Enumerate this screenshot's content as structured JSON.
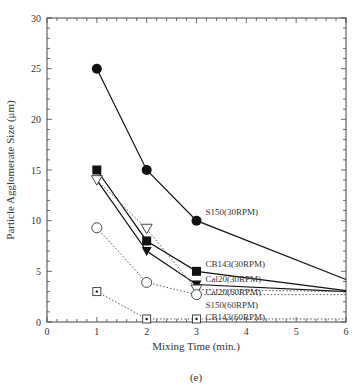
{
  "chart_data": {
    "type": "line",
    "title": "",
    "caption": "(e)",
    "xlabel": "Mixing Time (min.)",
    "ylabel": "Particle Agglomerate Size (μm)",
    "xlim": [
      0,
      6
    ],
    "ylim": [
      0,
      30
    ],
    "x_ticks": [
      0,
      1,
      2,
      3,
      4,
      5,
      6
    ],
    "y_ticks": [
      0,
      5,
      10,
      15,
      20,
      25,
      30
    ],
    "grid": false,
    "legend": "inline labels at x=3",
    "series": [
      {
        "name": "S150(30RPM)",
        "marker": "filled-circle",
        "line": "solid",
        "x": [
          1,
          2,
          3,
          6
        ],
        "values": [
          25,
          15,
          10,
          4.2
        ],
        "label_y": 10.9
      },
      {
        "name": "CB143(30RPM)",
        "marker": "filled-square",
        "line": "solid",
        "x": [
          1,
          2,
          3,
          6
        ],
        "values": [
          15,
          8,
          5,
          3.1
        ],
        "label_y": 5.7
      },
      {
        "name": "Cal20(30RPM)",
        "marker": "filled-triangle-down",
        "line": "solid",
        "x": [
          1,
          2,
          3,
          6
        ],
        "values": [
          14,
          7,
          3.7,
          3.0
        ],
        "label_y": 4.2
      },
      {
        "name": "Cal20(60RPM)",
        "marker": "open-triangle-down",
        "line": "dotted",
        "x": [
          1,
          2,
          3,
          6
        ],
        "values": [
          14,
          9.2,
          3.2,
          3.0
        ],
        "label_y": 3.0
      },
      {
        "name": "S150(60RPM)",
        "marker": "open-circle",
        "line": "dotted",
        "x": [
          1,
          2,
          3,
          6
        ],
        "values": [
          9.3,
          3.9,
          2.7,
          2.7
        ],
        "label_y": 1.7
      },
      {
        "name": "CB143(60RPM)",
        "marker": "dotted-square",
        "line": "dotted",
        "x": [
          1,
          2,
          3,
          6
        ],
        "values": [
          3,
          0.3,
          0.3,
          0.3
        ],
        "label_y": 0.5
      }
    ]
  }
}
